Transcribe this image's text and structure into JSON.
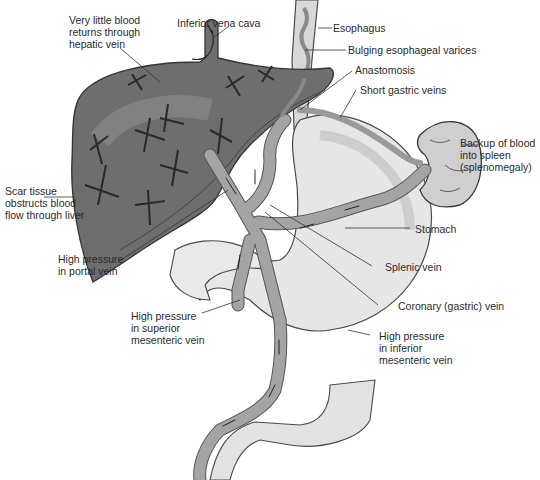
{
  "figure": {
    "colors": {
      "liver": "#6e6e6e",
      "liver_highlight": "#9a9a9a",
      "vein": "#9c9c9c",
      "vein_stroke": "#555555",
      "organ": "#dcdcdc",
      "organ_stroke": "#4a4a4a",
      "leader_line": "#333333",
      "text": "#2a2a2a"
    }
  },
  "labels": {
    "hepatic_vein": "Very little blood\nreturns through\nhepatic vein",
    "ivc": "Inferior vena cava",
    "esophagus": "Esophagus",
    "varices": "Bulging esophageal varices",
    "anastomosis": "Anastomosis",
    "short_gastric": "Short gastric veins",
    "spleen": "Backup of blood\ninto spleen\n(splenomegaly)",
    "scar_tissue": "Scar tissue\nobstructs blood\nflow through liver",
    "stomach": "Stomach",
    "portal_vein": "High pressure\nin portal vein",
    "splenic_vein": "Splenic vein",
    "coronary_vein": "Coronary (gastric) vein",
    "superior_mesenteric": "High pressure\nin superior\nmesenteric vein",
    "inferior_mesenteric": "High pressure\nin inferior\nmesenteric vein"
  }
}
